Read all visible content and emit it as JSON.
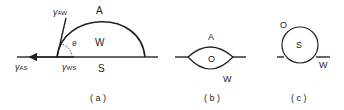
{
  "panels": [
    {
      "id": "a",
      "caption": "( a )",
      "phases": {
        "above": "A",
        "drop": "W",
        "below": "S"
      },
      "tensions": {
        "aw": "γ",
        "aw_sub": "AW",
        "as": "γ",
        "as_sub": "AS",
        "ws": "γ",
        "ws_sub": "WS"
      },
      "angle": "θ"
    },
    {
      "id": "b",
      "caption": "( b )",
      "phases": {
        "above": "A",
        "lens": "O",
        "below": "W"
      }
    },
    {
      "id": "c",
      "caption": "( c )",
      "phases": {
        "outer": "O",
        "particle": "S",
        "below": "W"
      }
    }
  ]
}
